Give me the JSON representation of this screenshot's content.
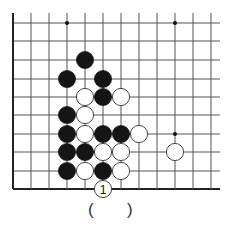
{
  "diagram": {
    "type": "go-problem",
    "board": {
      "grid_x": [
        13,
        31,
        49,
        67,
        85,
        103,
        121,
        139,
        157,
        175,
        193,
        211
      ],
      "grid_y": [
        23,
        41,
        60,
        79,
        97,
        115,
        134,
        152,
        171,
        189
      ],
      "line_extend_right": 220,
      "line_extend_top": 13,
      "left_edge": true,
      "bottom_edge": true,
      "line_color": "#555555",
      "edge_color": "#222222"
    },
    "star_points": [
      {
        "col": 3,
        "row": 0
      },
      {
        "col": 9,
        "row": 0
      },
      {
        "col": 9,
        "row": 6
      }
    ],
    "stones": [
      {
        "color": "black",
        "col": 4,
        "row": 2
      },
      {
        "color": "black",
        "col": 3,
        "row": 3
      },
      {
        "color": "black",
        "col": 5,
        "row": 3
      },
      {
        "color": "white",
        "col": 4,
        "row": 4
      },
      {
        "color": "black",
        "col": 5,
        "row": 4
      },
      {
        "color": "white",
        "col": 6,
        "row": 4
      },
      {
        "color": "black",
        "col": 3,
        "row": 5
      },
      {
        "color": "white",
        "col": 4,
        "row": 5
      },
      {
        "color": "black",
        "col": 3,
        "row": 6
      },
      {
        "color": "white",
        "col": 4,
        "row": 6
      },
      {
        "color": "black",
        "col": 5,
        "row": 6
      },
      {
        "color": "black",
        "col": 6,
        "row": 6
      },
      {
        "color": "white",
        "col": 7,
        "row": 6
      },
      {
        "color": "black",
        "col": 3,
        "row": 7
      },
      {
        "color": "black",
        "col": 4,
        "row": 7
      },
      {
        "color": "white",
        "col": 5,
        "row": 7
      },
      {
        "color": "white",
        "col": 6,
        "row": 7
      },
      {
        "color": "white",
        "col": 9,
        "row": 7
      },
      {
        "color": "black",
        "col": 3,
        "row": 8
      },
      {
        "color": "white",
        "col": 4,
        "row": 8
      },
      {
        "color": "black",
        "col": 5,
        "row": 8
      },
      {
        "color": "white",
        "col": 6,
        "row": 8
      },
      {
        "color": "white",
        "col": 5,
        "row": 9,
        "label": "1"
      }
    ],
    "answer_blank": {
      "open": "(",
      "close": ")"
    }
  }
}
